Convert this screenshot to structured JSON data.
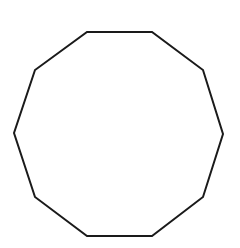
{
  "figure": {
    "shape": "decagon",
    "sides": 10,
    "stroke_color": "#1a1a1a",
    "fill_color": "#ffffff",
    "stroke_width": 2,
    "vertices": [
      [
        87,
        32
      ],
      [
        152,
        32
      ],
      [
        203,
        70
      ],
      [
        223,
        134
      ],
      [
        203,
        197
      ],
      [
        152,
        236
      ],
      [
        87,
        236
      ],
      [
        35,
        197
      ],
      [
        14,
        133
      ],
      [
        35,
        70
      ]
    ]
  }
}
